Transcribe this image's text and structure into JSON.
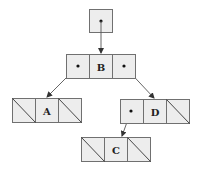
{
  "diagram": {
    "type": "binary-tree-linked-nodes",
    "root_pointer": {
      "label": "root pointer",
      "has_pointer": true
    },
    "nodes": [
      {
        "id": "B",
        "label": "B",
        "left": "pointer",
        "right": "pointer"
      },
      {
        "id": "A",
        "label": "A",
        "left": "null",
        "right": "null"
      },
      {
        "id": "D",
        "label": "D",
        "left": "pointer",
        "right": "null"
      },
      {
        "id": "C",
        "label": "C",
        "left": "null",
        "right": "null"
      }
    ],
    "edges": [
      {
        "from": "root",
        "to": "B"
      },
      {
        "from": "B.left",
        "to": "A"
      },
      {
        "from": "B.right",
        "to": "D"
      },
      {
        "from": "D.left",
        "to": "C"
      }
    ],
    "colors": {
      "cell_fill": "#ededed",
      "stroke": "#707070",
      "text": "#222222"
    }
  }
}
